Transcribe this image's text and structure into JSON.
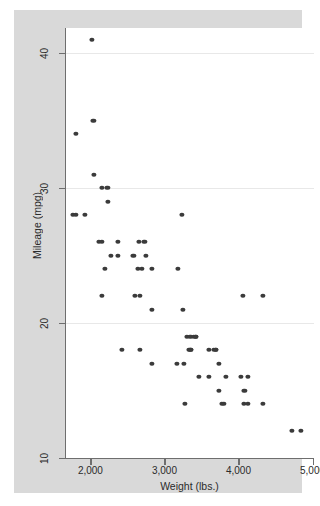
{
  "figure": {
    "background_color": "#ffffff",
    "graph_region_color": "#d9d9d9",
    "plot_area_color": "#ffffff",
    "marker_color": "#3b3b3b",
    "axis_color": "#6e6e6e",
    "gridline_color": "#e8e8e8"
  },
  "chart_data": {
    "type": "scatter",
    "title": "",
    "xlabel": "Weight (lbs.)",
    "ylabel": "Mileage (mpg)",
    "xlim": [
      1670,
      5020
    ],
    "ylim": [
      10,
      42.5
    ],
    "grid": true,
    "grid_axis": "y",
    "legend": null,
    "xticks": [
      2000,
      3000,
      4000,
      5000
    ],
    "xtick_labels": [
      "2,000",
      "3,000",
      "4,000",
      "5,000"
    ],
    "yticks": [
      10,
      20,
      30,
      40
    ],
    "ytick_labels": [
      "10",
      "20",
      "30",
      "40"
    ],
    "x": [
      2020,
      2040,
      1800,
      2050,
      2160,
      2230,
      1930,
      2240,
      1760,
      1800,
      3240,
      2110,
      2160,
      2370,
      2650,
      2730,
      2280,
      2370,
      2580,
      2750,
      2200,
      2640,
      2690,
      2830,
      3180,
      2160,
      2600,
      2670,
      4060,
      4330,
      2830,
      3250,
      3300,
      3350,
      3400,
      3420,
      3430,
      2430,
      2670,
      3330,
      3350,
      3360,
      3600,
      3670,
      3690,
      3700,
      2830,
      3170,
      3260,
      3740,
      3470,
      3600,
      3830,
      4030,
      4130,
      3740,
      4080,
      3280,
      3780,
      3800,
      4070,
      4130,
      4330,
      4720,
      4840
    ],
    "y": [
      41,
      35,
      34,
      31,
      30,
      30,
      28,
      29,
      28,
      28,
      28,
      26,
      26,
      26,
      26,
      26,
      25,
      25,
      25,
      25,
      24,
      24,
      24,
      24,
      24,
      22,
      22,
      22,
      22,
      22,
      21,
      21,
      19,
      19,
      19,
      19,
      19,
      18,
      18,
      18,
      18,
      18,
      18,
      18,
      18,
      18,
      17,
      17,
      17,
      17,
      16,
      16,
      16,
      16,
      16,
      15,
      15,
      14,
      14,
      14,
      14,
      14,
      14,
      12,
      12
    ]
  }
}
